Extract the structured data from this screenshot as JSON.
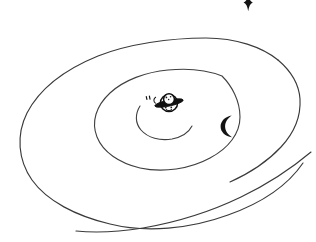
{
  "artwork": {
    "title": "Spiral Galaxy Sketch",
    "medium": "pen line drawing",
    "background_color": "#ffffff",
    "ink_color": "#3a3a3a",
    "accent_ink_color": "#141414",
    "canvas": {
      "width": 316,
      "height": 242
    }
  },
  "elements": {
    "outer_arm": {
      "label": "outer spiral arm",
      "icon": "spiral-arm-icon",
      "stroke_color": "#3a3a3a",
      "stroke_width": 1.15
    },
    "inner_arm": {
      "label": "inner spiral arm",
      "icon": "spiral-arm-icon",
      "stroke_color": "#3f3f3f",
      "stroke_width": 1.1
    },
    "core_arm": {
      "label": "galactic core swirl",
      "icon": "swirl-icon",
      "stroke_color": "#3f3f3f",
      "stroke_width": 1.1
    },
    "tail_arm": {
      "label": "trailing outer arm",
      "icon": "spiral-arm-icon",
      "stroke_color": "#3a3a3a",
      "stroke_width": 1.15
    },
    "planet": {
      "label": "ringed planet",
      "icon": "saturn-icon",
      "body_color": "#fdfdfd",
      "ring_color": "#111111",
      "outline_color": "#101010",
      "position": {
        "x": 169,
        "y": 103
      },
      "radius": 9
    },
    "moon": {
      "label": "crescent moon",
      "icon": "crescent-moon-icon",
      "color": "#141414",
      "position": {
        "x": 227,
        "y": 125
      }
    },
    "star_top": {
      "label": "four pointed star",
      "icon": "star-icon",
      "color": "#141414",
      "position": {
        "x": 248,
        "y": 3
      }
    },
    "spark_marks": {
      "label": "small spark marks",
      "icon": "sparkle-icon",
      "color": "#151515",
      "count": 3
    }
  }
}
